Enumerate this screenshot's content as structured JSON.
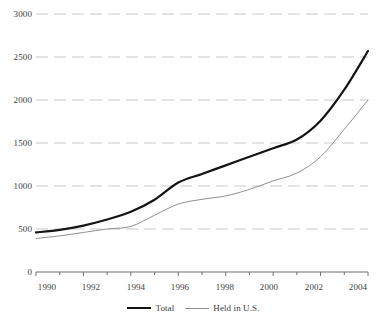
{
  "chart_data": {
    "type": "line",
    "title": "",
    "xlabel": "",
    "ylabel": "",
    "xlim": [
      1990,
      2004
    ],
    "ylim": [
      0,
      3000
    ],
    "grid": true,
    "legend_position": "bottom-center",
    "x": [
      1990,
      1991,
      1992,
      1993,
      1994,
      1995,
      1996,
      1997,
      1998,
      1999,
      2000,
      2001,
      2002,
      2003,
      2004
    ],
    "series": [
      {
        "name": "Total",
        "color": "#141414",
        "style": "thick",
        "values": [
          460,
          490,
          540,
          610,
          700,
          840,
          1040,
          1140,
          1240,
          1340,
          1440,
          1540,
          1760,
          2120,
          2570
        ]
      },
      {
        "name": "Held in U.S.",
        "color": "#8f8f8f",
        "style": "thin",
        "values": [
          390,
          420,
          460,
          500,
          530,
          660,
          790,
          845,
          885,
          960,
          1060,
          1150,
          1340,
          1660,
          2000
        ]
      }
    ],
    "y_ticks": [
      0,
      500,
      1000,
      1500,
      2000,
      2500,
      3000
    ],
    "y_tick_labels": [
      "0",
      "500",
      "1000",
      "1500",
      "2000",
      "2500",
      "3000"
    ],
    "x_major_ticks": [
      1990,
      1992,
      1994,
      1996,
      1998,
      2000,
      2002,
      2004
    ],
    "x_major_tick_labels": [
      "1990",
      "1992",
      "1994",
      "1996",
      "1998",
      "2000",
      "2002",
      "2004"
    ],
    "x_minor_ticks": [
      1991,
      1993,
      1995,
      1997,
      1999,
      2001,
      2003
    ],
    "colors": {
      "total_line": "#141414",
      "held_line": "#8f8f8f",
      "gridline": "#c9c9c9",
      "axis": "#6e6e6e",
      "text": "#3d3d3d",
      "background": "#ffffff"
    }
  },
  "legend": {
    "entries": [
      {
        "label": "Total"
      },
      {
        "label": "Held in U.S."
      }
    ]
  }
}
